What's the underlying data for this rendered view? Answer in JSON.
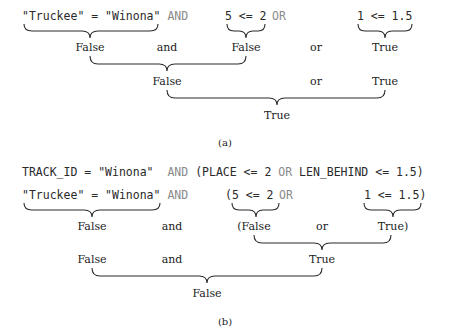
{
  "panel_a": {
    "caption": "(a)",
    "code": {
      "part1": "\"Truckee\" = \"Winona\"",
      "and": "AND",
      "part2": "5 <= 2",
      "or": "OR",
      "part3": "1 <= 1.5"
    },
    "level1": {
      "left": "False",
      "op1": "and",
      "mid": "False",
      "op2": "or",
      "right": "True"
    },
    "level2": {
      "left": "False",
      "op": "or",
      "right": "True"
    },
    "level3": {
      "result": "True"
    }
  },
  "panel_b": {
    "caption": "(b)",
    "expression": {
      "part1": "TRACK_ID = \"Winona\"",
      "and": "AND",
      "part2": "(PLACE <= 2",
      "or": "OR",
      "part3": "LEN_BEHIND <= 1.5)"
    },
    "code": {
      "part1": "\"Truckee\" = \"Winona\"",
      "and": "AND",
      "part2": "(5 <= 2",
      "or": "OR",
      "part3": "1 <= 1.5)"
    },
    "level1": {
      "left": "False",
      "op1": "and",
      "mid": "(False",
      "op2": "or",
      "right": "True)"
    },
    "level2": {
      "left": "False",
      "op": "and",
      "right": "True"
    },
    "level3": {
      "result": "False"
    }
  }
}
